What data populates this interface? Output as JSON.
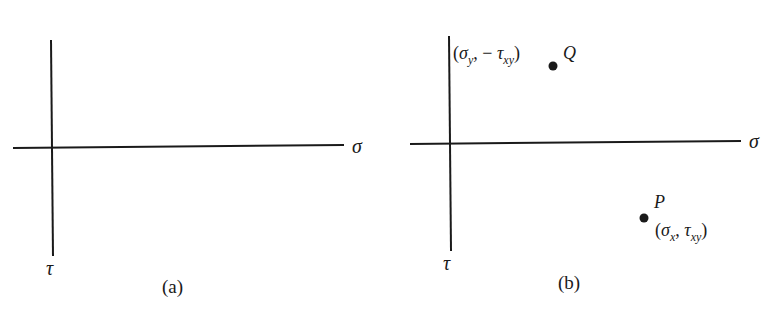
{
  "panels": [
    {
      "caption": "(a)",
      "x_axis_label": "σ",
      "y_axis_label": "τ",
      "points": []
    },
    {
      "caption": "(b)",
      "x_axis_label": "σ",
      "y_axis_label": "τ",
      "points": [
        {
          "name": "Q",
          "coord_open": "(",
          "coord_sigma": "σ",
          "coord_sigma_sub": "y",
          "coord_sep": ", − ",
          "coord_tau": "τ",
          "coord_tau_sub": "xy",
          "coord_close": ")"
        },
        {
          "name": "P",
          "coord_open": "(",
          "coord_sigma": "σ",
          "coord_sigma_sub": "x",
          "coord_sep": ", ",
          "coord_tau": "τ",
          "coord_tau_sub": "xy",
          "coord_close": ")"
        }
      ]
    }
  ],
  "colors": {
    "ink": "#1a1a1a",
    "background": "#ffffff"
  }
}
